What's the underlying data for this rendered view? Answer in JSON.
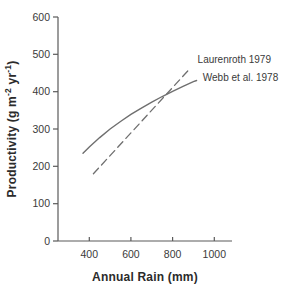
{
  "chart_data": {
    "type": "line",
    "title": "",
    "xlabel": "Annual Rain (mm)",
    "ylabel": "Productivity (g m-2 yr-1)",
    "ylabel_parts": [
      {
        "text": "Productivity (g m"
      },
      {
        "text": "-2",
        "superscript": true
      },
      {
        "text": " yr",
        "space_before": false
      },
      {
        "text": "-1",
        "superscript": true
      },
      {
        "text": ")"
      }
    ],
    "xlim": [
      250,
      1085
    ],
    "ylim": [
      0,
      600
    ],
    "xticks": [
      400,
      600,
      800,
      1000
    ],
    "yticks": [
      0,
      100,
      200,
      300,
      400,
      500,
      600
    ],
    "grid": false,
    "legend_position": "inline-annotations",
    "series": [
      {
        "name": "Laurenroth 1979",
        "line_style": "dashed",
        "points": [
          [
            420,
            180
          ],
          [
            880,
            460
          ]
        ]
      },
      {
        "name": "Webb et al. 1978",
        "line_style": "solid",
        "points": [
          [
            370,
            235
          ],
          [
            400,
            252
          ],
          [
            450,
            277
          ],
          [
            500,
            300
          ],
          [
            550,
            320
          ],
          [
            600,
            339
          ],
          [
            650,
            356
          ],
          [
            700,
            372
          ],
          [
            750,
            387
          ],
          [
            800,
            401
          ],
          [
            850,
            414
          ],
          [
            900,
            427
          ],
          [
            915,
            430
          ]
        ]
      }
    ],
    "annotations": [
      {
        "text": "Laurenroth 1979",
        "x": 920,
        "y": 478
      },
      {
        "text": "Webb et al. 1978",
        "x": 945,
        "y": 428
      }
    ],
    "colors": {
      "line": "#6f6f6f",
      "axis": "#5a5a5a",
      "text": "#3a3a3a",
      "background": "#ffffff"
    }
  }
}
